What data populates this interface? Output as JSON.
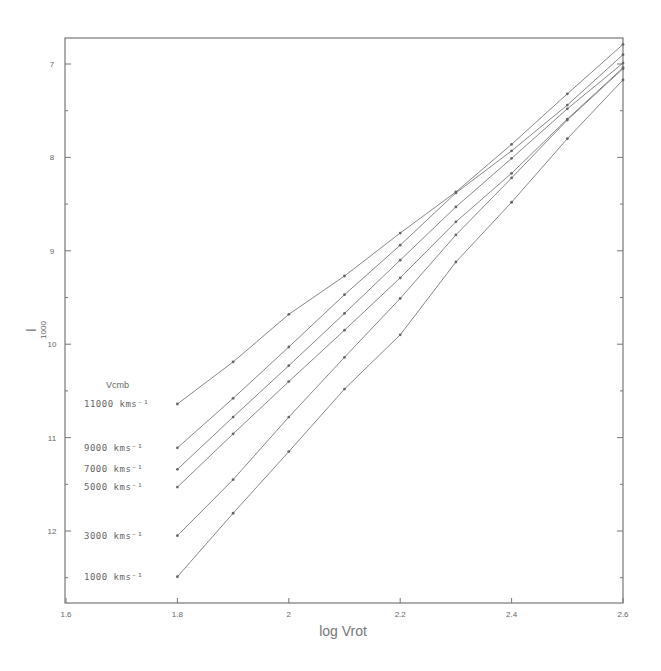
{
  "chart_data": {
    "type": "line",
    "title": "",
    "xlabel": "log Vrot",
    "ylabel": "I",
    "ylabel_subscript": "1000",
    "xlim": [
      1.6,
      2.6
    ],
    "ylim": [
      12.65,
      6.74
    ],
    "y_inverted": true,
    "grid": false,
    "x_ticks": [
      "1.6",
      "1.8",
      "2",
      "2.2",
      "2.4",
      "2.6"
    ],
    "y_ticks": [
      "7",
      "8",
      "9",
      "10",
      "11",
      "12"
    ],
    "legend_title": "Vcmb",
    "legend_position": "left, beside line starts",
    "x": [
      1.8,
      1.9,
      2.0,
      2.1,
      2.2,
      2.3,
      2.4,
      2.5,
      2.6
    ],
    "series": [
      {
        "name": "11000 kms⁻¹",
        "values": [
          10.64,
          10.19,
          9.68,
          9.27,
          8.81,
          8.37,
          7.86,
          7.32,
          6.79
        ]
      },
      {
        "name": "9000 kms⁻¹",
        "values": [
          11.11,
          10.58,
          10.03,
          9.47,
          8.94,
          8.38,
          7.93,
          7.44,
          6.9
        ]
      },
      {
        "name": "7000 kms⁻¹",
        "values": [
          11.34,
          10.78,
          10.23,
          9.67,
          9.1,
          8.53,
          8.01,
          7.48,
          6.99
        ]
      },
      {
        "name": "5000 kms⁻¹",
        "values": [
          11.53,
          10.96,
          10.4,
          9.85,
          9.29,
          8.69,
          8.17,
          7.59,
          7.04
        ]
      },
      {
        "name": "3000 kms⁻¹",
        "values": [
          12.05,
          11.45,
          10.78,
          10.14,
          9.51,
          8.83,
          8.22,
          7.6,
          7.05
        ]
      },
      {
        "name": "1000 kms⁻¹",
        "values": [
          12.49,
          11.81,
          11.15,
          10.48,
          9.9,
          9.12,
          8.48,
          7.8,
          7.17
        ]
      }
    ]
  },
  "labels": {
    "xlabel": "log Vrot",
    "ylabel": "I",
    "ylabel_sub": "1000",
    "legend_title": "Vcmb"
  }
}
